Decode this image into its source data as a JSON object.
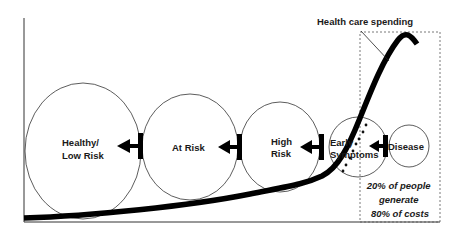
{
  "diagram": {
    "type": "health-risk-continuum",
    "curve_label": "Health care spending",
    "stages": [
      {
        "id": "healthy",
        "lines": [
          "Healthy/",
          "Low Risk"
        ],
        "cx": 83,
        "cy": 151,
        "rx": 58,
        "ry": 68
      },
      {
        "id": "at-risk",
        "lines": [
          "At Risk"
        ],
        "cx": 190,
        "cy": 147,
        "rx": 48,
        "ry": 53
      },
      {
        "id": "high-risk",
        "lines": [
          "High",
          "Risk"
        ],
        "cx": 280,
        "cy": 147,
        "rx": 40,
        "ry": 45
      },
      {
        "id": "early-symptoms",
        "lines": [
          "Early",
          "Symptoms"
        ],
        "cx": 358,
        "cy": 147,
        "rx": 29,
        "ry": 30
      },
      {
        "id": "disease",
        "lines": [
          "Disease"
        ],
        "cx": 409,
        "cy": 146,
        "rx": 20,
        "ry": 21
      }
    ],
    "arrows_direction": "right-to-left",
    "callout": {
      "lines": [
        "20% of people",
        "generate",
        "80% of costs"
      ]
    },
    "colors": {
      "line": "#1a1a1a",
      "curve": "#000000",
      "dashed_box": "#555555",
      "background": "#ffffff"
    }
  }
}
